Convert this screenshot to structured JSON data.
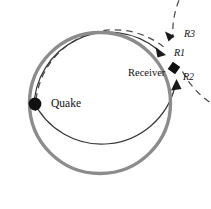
{
  "figure": {
    "name": "seismic-wave-paths-diagram",
    "background": "#ffffff",
    "width": 211,
    "height": 209
  },
  "colors": {
    "body_circle": "#8c8c8c",
    "thin_path": "#3a3a3a",
    "dashed_path": "#4a4a4a",
    "marker": "#111111",
    "text": "#111111"
  },
  "markers": [
    {
      "id": "quake",
      "label": "Quake",
      "shape": "filled-circle",
      "cx": 35,
      "cy": 104,
      "r": 6.5
    },
    {
      "id": "receiver",
      "label": "Receiver",
      "shape": "filled-diamond",
      "cx": 174,
      "cy": 68,
      "size": 6
    }
  ],
  "paths": [
    {
      "id": "r1",
      "label": "R1",
      "style": "solid",
      "description": "minor-arc wave path from quake clockwise to receiver"
    },
    {
      "id": "r2",
      "label": "R2",
      "style": "solid",
      "description": "major-arc wave path from quake counter-clockwise to receiver"
    },
    {
      "id": "r3",
      "label": "R3",
      "style": "dashed",
      "description": "wave path after one full orbit arriving at receiver"
    }
  ],
  "geometry": {
    "center_x": 100,
    "center_y": 103,
    "body_radius": 71,
    "body_stroke_width": 3.4
  }
}
